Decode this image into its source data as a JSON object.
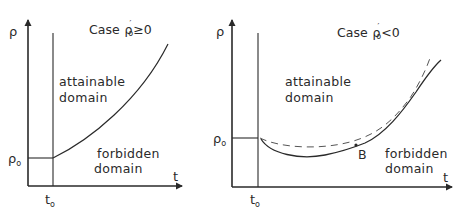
{
  "left_panel": {
    "case_label": "Case ρ′₀ ≥ 0",
    "case_prefix": "Case",
    "case_symbol": "ρ",
    "case_prime": "′",
    "case_sub": "o",
    "case_relation": "≥0",
    "y_axis_label": "ρ",
    "x_axis_label": "t",
    "y_tick_symbol": "ρ",
    "y_tick_sub": "o",
    "x_tick_symbol": "t",
    "x_tick_sub": "o",
    "region_upper_line1": "attainable",
    "region_upper_line2": "domain",
    "region_lower_line1": "forbidden",
    "region_lower_line2": "domain"
  },
  "right_panel": {
    "case_label": "Case ρ′₀ < 0",
    "case_prefix": "Case",
    "case_symbol": "ρ",
    "case_prime": "′",
    "case_sub": "o",
    "case_relation": "<0",
    "y_axis_label": "ρ",
    "x_axis_label": "t",
    "y_tick_symbol": "ρ",
    "y_tick_sub": "o",
    "x_tick_symbol": "t",
    "x_tick_sub": "o",
    "point_label": "B",
    "region_upper_line1": "attainable",
    "region_upper_line2": "domain",
    "region_lower_line1": "forbidden",
    "region_lower_line2": "domain"
  },
  "colors": {
    "ink": "#2a2a2a",
    "background": "#ffffff",
    "dashed": "#555555"
  }
}
